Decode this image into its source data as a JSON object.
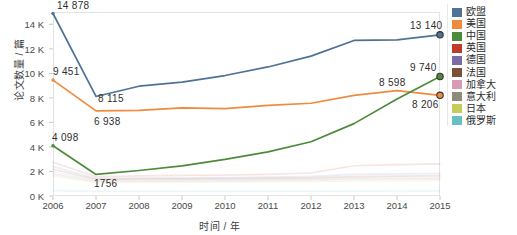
{
  "chart_data": {
    "type": "line",
    "title": "",
    "xlabel": "时间 / 年",
    "ylabel": "论文数量 / 篇",
    "categories": [
      "2006",
      "2007",
      "2008",
      "2009",
      "2010",
      "2011",
      "2012",
      "2013",
      "2014",
      "2015"
    ],
    "x": [
      2006,
      2007,
      2008,
      2009,
      2010,
      2011,
      2012,
      2013,
      2014,
      2015
    ],
    "ylim": [
      0,
      15000
    ],
    "xlim": [
      2006,
      2015
    ],
    "ytick_labels": [
      "0 K",
      "2 K",
      "4 K",
      "6 K",
      "8 K",
      "10 K",
      "12 K",
      "14 K"
    ],
    "ytick_values": [
      0,
      2000,
      4000,
      6000,
      8000,
      10000,
      12000,
      14000
    ],
    "grid": false,
    "legend_position": "right",
    "series": [
      {
        "name": "欧盟",
        "color": "#4f7296",
        "values": [
          14878,
          8115,
          8950,
          9280,
          9820,
          10520,
          11400,
          12680,
          12720,
          13140
        ]
      },
      {
        "name": "美国",
        "color": "#f08a3c",
        "values": [
          9451,
          6938,
          6980,
          7180,
          7120,
          7380,
          7560,
          8200,
          8598,
          8206
        ]
      },
      {
        "name": "中国",
        "color": "#4c8b3b",
        "values": [
          4098,
          1756,
          2080,
          2460,
          2980,
          3600,
          4420,
          5900,
          7900,
          9740
        ]
      },
      {
        "name": "英国",
        "color": "#c0392b",
        "values": [
          2760,
          1560,
          1640,
          1680,
          1700,
          1760,
          1880,
          2460,
          2560,
          2620
        ]
      },
      {
        "name": "德国",
        "color": "#7b6aa8",
        "values": [
          2400,
          1420,
          1460,
          1480,
          1500,
          1540,
          1600,
          1760,
          1800,
          1840
        ]
      },
      {
        "name": "法国",
        "color": "#7c5037",
        "values": [
          2180,
          1340,
          1380,
          1400,
          1420,
          1440,
          1480,
          1580,
          1620,
          1660
        ]
      },
      {
        "name": "加拿大",
        "color": "#d99bb4",
        "values": [
          1980,
          1260,
          1300,
          1320,
          1340,
          1360,
          1400,
          1480,
          1500,
          1520
        ]
      },
      {
        "name": "意大利",
        "color": "#8c8c78",
        "values": [
          1800,
          1180,
          1200,
          1220,
          1240,
          1260,
          1300,
          1360,
          1380,
          1400
        ]
      },
      {
        "name": "日本",
        "color": "#c5cc5a",
        "values": [
          1640,
          1080,
          1100,
          1120,
          1140,
          1160,
          1180,
          1220,
          1240,
          1260
        ]
      },
      {
        "name": "俄罗斯",
        "color": "#67c0c4",
        "values": [
          440,
          380,
          380,
          380,
          380,
          380,
          390,
          400,
          410,
          420
        ]
      }
    ],
    "annotations": [
      {
        "label": "14 878",
        "series": "欧盟",
        "x": 2006
      },
      {
        "label": "9 451",
        "series": "美国",
        "x": 2006
      },
      {
        "label": "8 115",
        "series": "欧盟",
        "x": 2007
      },
      {
        "label": "6 938",
        "series": "美国",
        "x": 2007
      },
      {
        "label": "4 098",
        "series": "中国",
        "x": 2006
      },
      {
        "label": "1756",
        "series": "中国",
        "x": 2007
      },
      {
        "label": "8 598",
        "series": "美国",
        "x": 2014
      },
      {
        "label": "13 140",
        "series": "欧盟",
        "x": 2015
      },
      {
        "label": "9 740",
        "series": "中国",
        "x": 2015
      },
      {
        "label": "8 206",
        "series": "美国",
        "x": 2015
      }
    ],
    "markers": [
      {
        "series": "欧盟",
        "x": 2015,
        "value": 13140
      },
      {
        "series": "中国",
        "x": 2015,
        "value": 9740
      },
      {
        "series": "美国",
        "x": 2015,
        "value": 8206
      }
    ]
  },
  "legend": {
    "items": [
      {
        "label": "欧盟",
        "color": "#4f7296"
      },
      {
        "label": "美国",
        "color": "#f08a3c"
      },
      {
        "label": "中国",
        "color": "#4c8b3b"
      },
      {
        "label": "英国",
        "color": "#c0392b"
      },
      {
        "label": "德国",
        "color": "#7b6aa8"
      },
      {
        "label": "法国",
        "color": "#7c5037"
      },
      {
        "label": "加拿大",
        "color": "#d99bb4"
      },
      {
        "label": "意大利",
        "color": "#8c8c78"
      },
      {
        "label": "日本",
        "color": "#c5cc5a"
      },
      {
        "label": "俄罗斯",
        "color": "#67c0c4"
      }
    ]
  }
}
